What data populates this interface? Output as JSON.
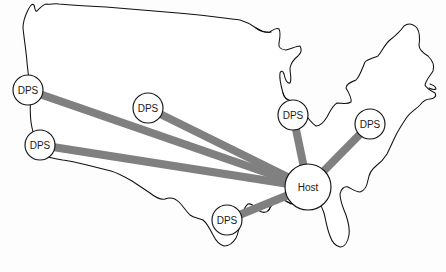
{
  "figure": {
    "background_color": "#fdfdfd",
    "outline_color": "#101010",
    "link_color": "#808080",
    "node_fill": "#ffffff",
    "node_stroke": "#151515",
    "label_color": "#1a1a1a",
    "width": 446,
    "height": 272
  },
  "nodes": [
    {
      "id": "dps-northwest",
      "label": "DPS",
      "role": "DPS",
      "cx": 28,
      "cy": 90,
      "r": 15
    },
    {
      "id": "dps-southwest",
      "label": "DPS",
      "role": "DPS",
      "cx": 40,
      "cy": 145,
      "r": 15
    },
    {
      "id": "dps-central",
      "label": "DPS",
      "role": "DPS",
      "cx": 148,
      "cy": 108,
      "r": 15
    },
    {
      "id": "dps-greatlakes",
      "label": "DPS",
      "role": "DPS",
      "cx": 293,
      "cy": 115,
      "r": 15
    },
    {
      "id": "dps-northeast",
      "label": "DPS",
      "role": "DPS",
      "cx": 370,
      "cy": 124,
      "r": 15
    },
    {
      "id": "dps-south",
      "label": "DPS",
      "role": "DPS",
      "cx": 227,
      "cy": 220,
      "r": 15
    },
    {
      "id": "host",
      "label": "Host",
      "role": "Host",
      "cx": 308,
      "cy": 187,
      "r": 23
    }
  ],
  "links": [
    {
      "id": "link-host-dps-northwest",
      "from": "host",
      "to": "dps-northwest",
      "width": 8
    },
    {
      "id": "link-host-dps-southwest",
      "from": "host",
      "to": "dps-southwest",
      "width": 8
    },
    {
      "id": "link-host-dps-central",
      "from": "host",
      "to": "dps-central",
      "width": 8
    },
    {
      "id": "link-host-dps-greatlakes",
      "from": "host",
      "to": "dps-greatlakes",
      "width": 8
    },
    {
      "id": "link-host-dps-northeast",
      "from": "host",
      "to": "dps-northeast",
      "width": 8
    },
    {
      "id": "link-host-dps-south",
      "from": "host",
      "to": "dps-south",
      "width": 8
    }
  ],
  "map_outline": {
    "name": "united-states-contiguous",
    "path": "M 29,96 L 26,84 L 24,72 L 22,58 L 21,46 L 20,34 L 24,24 L 29,13 L 32,6 L 34,4 L 36,8 L 37,12 L 40,9 L 43,5 L 46,3 L 49,6 L 52,4 L 56,3 L 62,4 L 72,5 L 86,6 L 104,7 L 124,8 L 146,10 L 170,12 L 194,14 L 216,16 L 236,19 L 248,21 L 254,23 L 258,26 L 262,29 L 266,31 L 270,32 L 273,30 L 276,28 L 279,30 L 281,34 L 280,39 L 278,43 L 278,47 L 281,49 L 286,49 L 291,47 L 295,45 L 299,45 L 301,48 L 300,52 L 297,55 L 293,58 L 291,62 L 290,67 L 291,72 L 292,76 L 291,80 L 288,82 L 286,80 L 285,76 L 284,72 L 282,70 L 280,72 L 279,77 L 280,83 L 282,88 L 283,93 L 283,98 L 286,100 L 290,100 L 293,102 L 296,105 L 300,107 L 303,110 L 306,115 L 309,120 L 313,124 L 317,126 L 321,124 L 324,121 L 327,117 L 330,113 L 332,108 L 334,104 L 337,102 L 341,103 L 345,104 L 349,103 L 351,100 L 350,96 L 347,92 L 345,88 L 346,84 L 350,82 L 354,81 L 357,79 L 359,75 L 361,70 L 363,65 L 366,61 L 370,59 L 374,58 L 378,56 L 381,52 L 383,47 L 386,43 L 390,40 L 394,38 L 398,35 L 401,31 L 403,27 L 406,24 L 410,23 L 414,25 L 417,28 L 419,32 L 420,37 L 419,42 L 418,47 L 420,51 L 424,53 L 428,55 L 431,58 L 433,62 L 434,67 L 433,72 L 430,76 L 427,79 L 425,83 L 426,87 L 429,89 L 432,90 L 435,92 L 436,95 L 434,98 L 431,99 L 428,98 L 425,99 L 423,102 L 420,105 L 416,107 L 412,110 L 409,114 L 406,118 L 403,122 L 400,126 L 397,131 L 394,136 L 392,141 L 390,146 L 388,151 L 386,156 L 383,160 L 380,163 L 377,165 L 374,167 L 371,170 L 369,174 L 368,179 L 367,184 L 365,188 L 362,191 L 359,192 L 356,191 L 353,189 L 350,187 L 347,186 L 344,187 L 342,190 L 341,194 L 341,199 L 342,204 L 344,209 L 346,214 L 348,219 L 349,224 L 350,229 L 350,234 L 349,239 L 347,243 L 344,246 L 341,247 L 337,246 L 334,243 L 331,239 L 329,234 L 327,229 L 326,224 L 325,218 L 324,212 L 322,207 L 320,202 L 317,198 L 314,196 L 311,196 L 308,197 L 305,199 L 302,201 L 299,203 L 296,204 L 293,204 L 290,203 L 287,201 L 284,199 L 281,198 L 278,199 L 275,201 L 273,204 L 271,207 L 269,210 L 266,212 L 263,212 L 260,211 L 258,209 L 256,206 L 254,204 L 251,203 L 248,204 L 246,207 L 244,211 L 242,216 L 241,221 L 240,226 L 239,231 L 237,236 L 234,240 L 231,243 L 228,245 L 225,246 L 222,245 L 219,243 L 217,240 L 215,236 L 213,232 L 211,228 L 209,224 L 206,221 L 203,219 L 200,218 L 197,218 L 194,217 L 191,215 L 189,212 L 187,209 L 185,206 L 183,203 L 181,200 L 178,198 L 175,197 L 172,197 L 169,198 L 166,199 L 163,199 L 160,198 L 157,196 L 154,194 L 151,192 L 148,190 L 145,188 L 142,186 L 139,184 L 136,182 L 133,180 L 130,178 L 127,176 L 124,174 L 121,172 L 118,171 L 115,170 L 112,169 L 109,168 L 106,167 L 103,166 L 100,165 L 97,164 L 94,163 L 91,162 L 88,161 L 85,160 L 82,159 L 79,158 L 76,158 L 73,157 L 70,157 L 67,157 L 64,157 L 61,157 L 58,157 L 55,157 L 52,157 L 49,157 L 46,156 L 43,155 L 41,153 L 39,150 L 37,147 L 36,144 L 34,141 L 33,138 L 32,135 L 31,132 L 30,128 L 30,124 L 30,120 L 30,116 L 30,112 L 30,108 L 30,104 L 29,100 Z"
  }
}
